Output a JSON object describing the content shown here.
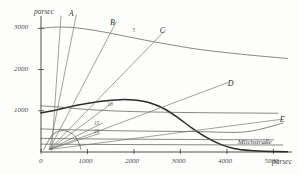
{
  "figure": {
    "title": "",
    "y_axis_unit": "parsec",
    "x_axis_unit": "parsec",
    "milky_way_label": "Milchstraße"
  },
  "chart_data": {
    "type": "line",
    "title": "",
    "xlabel": "parsec",
    "ylabel": "parsec",
    "xlim": [
      0,
      5400
    ],
    "ylim": [
      0,
      3300
    ],
    "xticks": [
      0,
      1000,
      2000,
      3000,
      4000,
      5000
    ],
    "xtick_labels": [
      "0",
      "1000",
      "2000",
      "3000",
      "4000",
      "5000"
    ],
    "yticks": [
      1000,
      2000,
      3000
    ],
    "ytick_labels": [
      "1000",
      "2000",
      "3000"
    ],
    "grid": false,
    "legend_position": "inline-annotations",
    "annotations": [
      {
        "text": "A",
        "x": 640,
        "y": 3320
      },
      {
        "text": "B",
        "x": 1530,
        "y": 3100
      },
      {
        "text": "C",
        "x": 2600,
        "y": 2920
      },
      {
        "text": "D",
        "x": 4060,
        "y": 1620
      },
      {
        "text": "E",
        "x": 5180,
        "y": 760
      },
      {
        "text": "5",
        "x": 2010,
        "y": 2880
      },
      {
        "text": "10",
        "x": 1470,
        "y": 1090
      },
      {
        "text": "15",
        "x": 1180,
        "y": 640
      },
      {
        "text": "20",
        "x": 1180,
        "y": 430
      },
      {
        "text": "Milchstraße",
        "x": 4750,
        "y": 190
      }
    ],
    "series": [
      {
        "name": "upper-envelope",
        "style": "thin",
        "points": [
          [
            0,
            3000
          ],
          [
            300,
            3030
          ],
          [
            700,
            3020
          ],
          [
            1100,
            2960
          ],
          [
            1500,
            2880
          ],
          [
            1900,
            2790
          ],
          [
            2400,
            2680
          ],
          [
            2900,
            2580
          ],
          [
            3400,
            2490
          ],
          [
            4000,
            2410
          ],
          [
            4600,
            2340
          ],
          [
            5300,
            2270
          ]
        ]
      },
      {
        "name": "main-distribution",
        "style": "bold",
        "points": [
          [
            0,
            950
          ],
          [
            250,
            1000
          ],
          [
            550,
            1080
          ],
          [
            900,
            1160
          ],
          [
            1300,
            1230
          ],
          [
            1700,
            1270
          ],
          [
            2000,
            1260
          ],
          [
            2350,
            1190
          ],
          [
            2650,
            1050
          ],
          [
            2950,
            830
          ],
          [
            3250,
            580
          ],
          [
            3550,
            360
          ],
          [
            3850,
            190
          ],
          [
            4150,
            85
          ],
          [
            4500,
            35
          ],
          [
            5000,
            10
          ],
          [
            5300,
            5
          ]
        ]
      },
      {
        "name": "secondary-plateau",
        "style": "thin",
        "points": [
          [
            0,
            1120
          ],
          [
            400,
            1090
          ],
          [
            900,
            1040
          ],
          [
            1500,
            1000
          ],
          [
            2200,
            975
          ],
          [
            3000,
            960
          ],
          [
            3800,
            950
          ],
          [
            4500,
            945
          ],
          [
            5100,
            940
          ]
        ]
      },
      {
        "name": "low-band-1",
        "style": "thin",
        "points": [
          [
            0,
            560
          ],
          [
            600,
            540
          ],
          [
            1400,
            520
          ],
          [
            2400,
            505
          ],
          [
            3400,
            495
          ],
          [
            4400,
            488
          ],
          [
            5200,
            700
          ]
        ]
      },
      {
        "name": "low-band-2",
        "style": "thin",
        "points": [
          [
            0,
            330
          ],
          [
            800,
            320
          ],
          [
            1800,
            312
          ],
          [
            2900,
            305
          ],
          [
            4000,
            300
          ],
          [
            5000,
            296
          ]
        ]
      },
      {
        "name": "low-band-3",
        "style": "thin",
        "points": [
          [
            0,
            190
          ],
          [
            900,
            185
          ],
          [
            2000,
            180
          ],
          [
            3200,
            176
          ],
          [
            4300,
            172
          ],
          [
            5200,
            170
          ]
        ]
      },
      {
        "name": "ray-A",
        "style": "ray",
        "points": [
          [
            180,
            60
          ],
          [
            760,
            3330
          ]
        ]
      },
      {
        "name": "ray-B",
        "style": "ray",
        "points": [
          [
            180,
            60
          ],
          [
            1620,
            3160
          ]
        ]
      },
      {
        "name": "ray-C",
        "style": "ray",
        "points": [
          [
            180,
            60
          ],
          [
            2680,
            2960
          ]
        ]
      },
      {
        "name": "ray-D",
        "style": "ray",
        "points": [
          [
            180,
            60
          ],
          [
            4030,
            1690
          ]
        ]
      },
      {
        "name": "ray-E",
        "style": "ray",
        "points": [
          [
            180,
            60
          ],
          [
            5150,
            790
          ]
        ]
      },
      {
        "name": "ray-inner-1",
        "style": "ray",
        "points": [
          [
            180,
            60
          ],
          [
            1520,
            1180
          ]
        ]
      },
      {
        "name": "ray-inner-2",
        "style": "ray",
        "points": [
          [
            180,
            60
          ],
          [
            1320,
            700
          ]
        ]
      },
      {
        "name": "ray-inner-3",
        "style": "ray",
        "points": [
          [
            180,
            60
          ],
          [
            1260,
            450
          ]
        ]
      },
      {
        "name": "ray-steep-1",
        "style": "ray",
        "points": [
          [
            230,
            40
          ],
          [
            430,
            3300
          ]
        ]
      },
      {
        "name": "cluster-arc",
        "style": "thin",
        "points": [
          [
            60,
            60
          ],
          [
            250,
            420
          ],
          [
            480,
            520
          ],
          [
            700,
            420
          ],
          [
            820,
            200
          ],
          [
            860,
            60
          ]
        ]
      }
    ]
  }
}
